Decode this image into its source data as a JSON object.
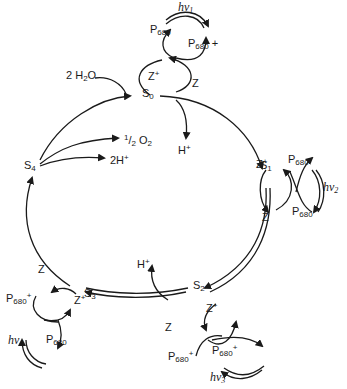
{
  "diagram": {
    "states": [
      {
        "id": "S0",
        "label": "S",
        "sub": "0"
      },
      {
        "id": "S1",
        "label": "S",
        "sub": "1"
      },
      {
        "id": "S2",
        "label": "S",
        "sub": "2"
      },
      {
        "id": "S3",
        "label": "S",
        "sub": "3"
      },
      {
        "id": "S4",
        "label": "S",
        "sub": "4"
      }
    ],
    "inputs": {
      "water": "2 H",
      "water_sub": "2",
      "water_tail": "O"
    },
    "outputs": {
      "o2_num": "1",
      "o2_den": "2",
      "o2": "O",
      "o2_sub": "2",
      "protons_s4": "2H",
      "protons_s0": "H",
      "protons_s2": "H",
      "plus": "+"
    },
    "photosystem": {
      "p": "P",
      "p_sub": "680",
      "z": "Z",
      "plus": "+",
      "light": [
        {
          "label": "hν",
          "sub": "1"
        },
        {
          "label": "hν",
          "sub": "2"
        },
        {
          "label": "hν",
          "sub": "3"
        },
        {
          "label": "hν",
          "sub": "4"
        }
      ]
    }
  }
}
